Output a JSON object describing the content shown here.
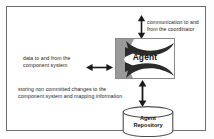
{
  "figure": {
    "border_color": "#6e6e6e",
    "background": "#ffffff"
  },
  "nodes": {
    "agent": {
      "label": "Agent",
      "shape": "decorated-rectangle",
      "fill": "#ffffff",
      "border_color": "#8a8a8a",
      "decoration_color": "#2b2b2b"
    },
    "repository": {
      "label": "Agent\nRepository",
      "shape": "cylinder",
      "fill": "#ffffff",
      "border_color": "#4f4f4f"
    }
  },
  "labels": {
    "coordinator": "communication to and\nfrom the coordinator",
    "component": "data to and from the\ncomponent system",
    "storing": "storing non committed changes to the\ncomponent system and mapping information"
  },
  "connectors": [
    {
      "name": "agent-to-coordinator",
      "orientation": "vertical",
      "heads": "both",
      "color": "#1a1a1a"
    },
    {
      "name": "agent-to-component-system",
      "orientation": "horizontal",
      "heads": "both",
      "color": "#1a1a1a"
    },
    {
      "name": "agent-to-repository",
      "orientation": "vertical",
      "heads": "both",
      "color": "#1a1a1a"
    }
  ]
}
